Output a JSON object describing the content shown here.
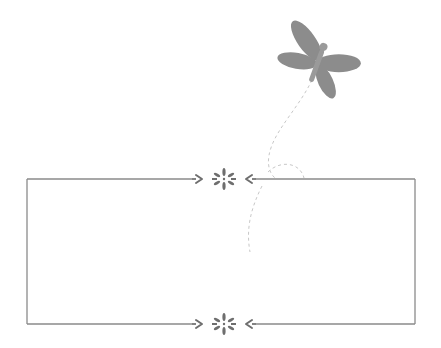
{
  "image": {
    "description": "Decorative blank rectangular frame with ornaments and a dragonfly with a dashed flight trail",
    "colors": {
      "background": "#ffffff",
      "frame_line": "#8a8a8a",
      "ornament": "#6e6e6e",
      "dragonfly_wings": "#8c8c8c",
      "dragonfly_body": "#9a9a9a",
      "trail": "#c4c4c4"
    }
  },
  "frame": {
    "x": 27,
    "y": 179,
    "width": 388,
    "height": 145
  },
  "ornaments": [
    {
      "name": "top-ornament",
      "cx": 224,
      "cy": 179
    },
    {
      "name": "bottom-ornament",
      "cx": 224,
      "cy": 324
    }
  ],
  "dragonfly": {
    "cx": 318,
    "cy": 62
  }
}
